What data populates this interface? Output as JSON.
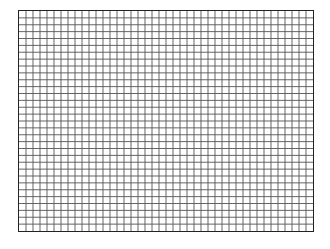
{
  "grid": {
    "columns": 42,
    "rows": 32,
    "line_color": "#555555",
    "border_color": "#222222",
    "background": "#ffffff"
  }
}
